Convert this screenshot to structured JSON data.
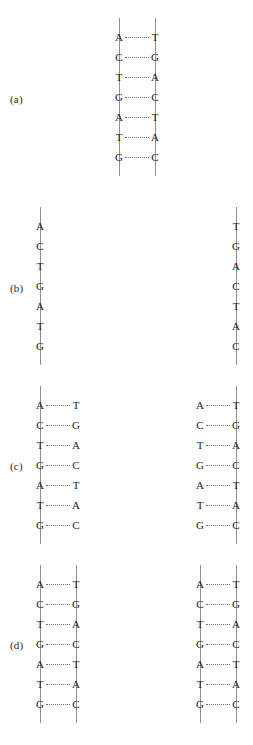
{
  "figure": {
    "background_color": "#ffffff",
    "backbone_color": "#8f8f8f",
    "bond_color": "#6f6f6f",
    "text_color": "#1a1a1a"
  },
  "sequences": {
    "template_left": [
      "A",
      "C",
      "T",
      "G",
      "A",
      "T",
      "G"
    ],
    "template_right": [
      "T",
      "G",
      "A",
      "C",
      "T",
      "A",
      "C"
    ]
  },
  "panels": [
    {
      "id": "a",
      "label": "(a)",
      "label_x": 10,
      "label_y": 94,
      "caption": "Parent DNA double helix",
      "groups": [
        {
          "name": "parent-duplex",
          "x": 103,
          "y": 18,
          "width": 68,
          "height": 158,
          "left_backbone": 16,
          "right_backbone": 52,
          "show_left_backbone": true,
          "show_right_backbone": true,
          "show_bonds": true,
          "left_bases": [
            "A",
            "C",
            "T",
            "G",
            "A",
            "T",
            "G"
          ],
          "right_bases": [
            "T",
            "G",
            "A",
            "C",
            "T",
            "A",
            "C"
          ]
        }
      ]
    },
    {
      "id": "b",
      "label": "(b)",
      "label_x": 10,
      "label_y": 283,
      "caption": "Strands separate",
      "groups": [
        {
          "name": "separated-strand-left",
          "x": 24,
          "y": 207,
          "width": 68,
          "height": 158,
          "left_backbone": 16,
          "right_backbone": 52,
          "show_left_backbone": true,
          "show_right_backbone": false,
          "show_bonds": false,
          "left_bases": [
            "A",
            "C",
            "T",
            "G",
            "A",
            "T",
            "G"
          ],
          "right_bases": [
            "",
            "",
            "",
            "",
            "",
            "",
            ""
          ]
        },
        {
          "name": "separated-strand-right",
          "x": 184,
          "y": 207,
          "width": 68,
          "height": 158,
          "left_backbone": 16,
          "right_backbone": 52,
          "show_left_backbone": false,
          "show_right_backbone": true,
          "show_bonds": false,
          "left_bases": [
            "",
            "",
            "",
            "",
            "",
            "",
            ""
          ],
          "right_bases": [
            "T",
            "G",
            "A",
            "C",
            "T",
            "A",
            "C"
          ]
        }
      ]
    },
    {
      "id": "c",
      "label": "(c)",
      "label_x": 10,
      "label_y": 461,
      "caption": "Free nucleotides pair with each template strand",
      "groups": [
        {
          "name": "pairing-group-left",
          "x": 24,
          "y": 386,
          "width": 68,
          "height": 158,
          "left_backbone": 16,
          "right_backbone": 52,
          "show_left_backbone": true,
          "show_right_backbone": false,
          "show_bonds": true,
          "left_bases": [
            "A",
            "C",
            "T",
            "G",
            "A",
            "T",
            "G"
          ],
          "right_bases": [
            "T",
            "G",
            "A",
            "C",
            "T",
            "A",
            "C"
          ]
        },
        {
          "name": "pairing-group-right",
          "x": 184,
          "y": 386,
          "width": 68,
          "height": 158,
          "left_backbone": 16,
          "right_backbone": 52,
          "show_left_backbone": false,
          "show_right_backbone": true,
          "show_bonds": true,
          "left_bases": [
            "A",
            "C",
            "T",
            "G",
            "A",
            "T",
            "G"
          ],
          "right_bases": [
            "T",
            "G",
            "A",
            "C",
            "T",
            "A",
            "C"
          ]
        }
      ]
    },
    {
      "id": "d",
      "label": "(d)",
      "label_x": 10,
      "label_y": 640,
      "caption": "Two identical daughter DNA molecules",
      "groups": [
        {
          "name": "daughter-duplex-left",
          "x": 24,
          "y": 565,
          "width": 68,
          "height": 158,
          "left_backbone": 16,
          "right_backbone": 52,
          "show_left_backbone": true,
          "show_right_backbone": true,
          "show_bonds": true,
          "left_bases": [
            "A",
            "C",
            "T",
            "G",
            "A",
            "T",
            "G"
          ],
          "right_bases": [
            "T",
            "G",
            "A",
            "C",
            "T",
            "A",
            "C"
          ]
        },
        {
          "name": "daughter-duplex-right",
          "x": 184,
          "y": 565,
          "width": 68,
          "height": 158,
          "left_backbone": 16,
          "right_backbone": 52,
          "show_left_backbone": true,
          "show_right_backbone": true,
          "show_bonds": true,
          "left_bases": [
            "A",
            "C",
            "T",
            "G",
            "A",
            "T",
            "G"
          ],
          "right_bases": [
            "T",
            "G",
            "A",
            "C",
            "T",
            "A",
            "C"
          ]
        }
      ]
    }
  ],
  "layout": {
    "row_count": 7,
    "row_step": 20,
    "first_row_offset": 12
  }
}
